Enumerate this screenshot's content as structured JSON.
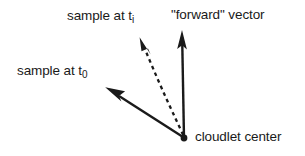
{
  "figure": {
    "background_color": "#ffffff",
    "ink_color": "#1a1a1a",
    "width": 305,
    "height": 156,
    "labels": {
      "sample_ti": {
        "text": "sample at t",
        "subscript": "i"
      },
      "forward_vector": {
        "text": "\"forward\" vector"
      },
      "sample_t0": {
        "text": "sample at t",
        "subscript": "0"
      },
      "cloudlet_center": {
        "text": "cloudlet center"
      }
    },
    "geometry": {
      "origin": {
        "x": 184,
        "y": 138,
        "dot_radius": 3.4
      },
      "vectors": [
        {
          "name": "forward-vector-arrow",
          "style": "solid",
          "from": {
            "x": 184,
            "y": 138
          },
          "to": {
            "x": 182,
            "y": 31
          },
          "arrowhead": "narrow-elongated"
        },
        {
          "name": "sample-ti-arrow",
          "style": "dashed",
          "dash_pattern": "3.5 3.5",
          "from": {
            "x": 184,
            "y": 138
          },
          "control": {
            "x": 160,
            "y": 86
          },
          "to": {
            "x": 141,
            "y": 39
          },
          "arrowhead": "narrow-elongated"
        },
        {
          "name": "sample-t0-arrow",
          "style": "solid",
          "from": {
            "x": 184,
            "y": 138
          },
          "to": {
            "x": 106,
            "y": 88
          },
          "arrowhead": "narrow-elongated"
        }
      ]
    }
  }
}
